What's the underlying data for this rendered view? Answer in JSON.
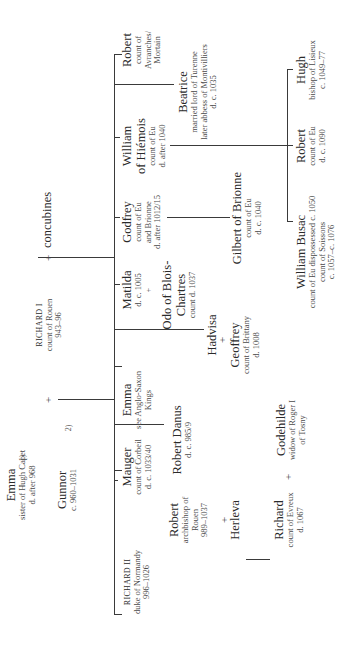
{
  "diagram": {
    "type": "genealogy",
    "orientation": "rotated-90-ccw",
    "generation_0": {
      "emma": {
        "name": "Emma",
        "lines": [
          "sister of Hugh Capet",
          "d. after 968"
        ],
        "marker": "1)"
      },
      "gunnor": {
        "name": "Gunnor",
        "lines": [
          "c. 960–1031"
        ],
        "marker": "2)"
      },
      "richard_i": {
        "name": "RICHARD I",
        "lines": [
          "count of Rouen",
          "943–96"
        ]
      },
      "concubines": {
        "name": "concubines"
      },
      "plus": "+"
    },
    "generation_1": [
      {
        "id": "richard_ii",
        "name": "RICHARD II",
        "lines": [
          "duke of Normandy",
          "996–1026"
        ]
      },
      {
        "id": "robert_abp",
        "name": "Robert",
        "lines": [
          "archbishop of",
          "Rouen",
          "989–1037"
        ]
      },
      {
        "id": "mauger",
        "name": "Mauger",
        "lines": [
          "count of Corbeil",
          "d. c. 1033/40"
        ]
      },
      {
        "id": "robert_danus",
        "name": "Robert Danus",
        "lines": [
          "d. c. 985/9"
        ]
      },
      {
        "id": "emma2",
        "name": "Emma",
        "lines": [
          "see Anglo-Saxon",
          "Kings"
        ]
      },
      {
        "id": "hadvisa",
        "name": "Hadvisa"
      },
      {
        "id": "matilda",
        "name": "Matilda",
        "lines": [
          "d. c. 1005"
        ]
      },
      {
        "id": "godfrey",
        "name": "Godfrey",
        "lines": [
          "count of Eu",
          "and Brionne",
          "d. after 1012/15"
        ]
      },
      {
        "id": "william_hiemois",
        "name": "William",
        "name2": "of Hiémois",
        "lines": [
          "count of Eu",
          "d. after 1040"
        ]
      },
      {
        "id": "beatrice",
        "name": "Beatrice",
        "lines": [
          "married lord of Turenne",
          "later abbess of Montivilliers",
          "d. c. 1035"
        ]
      },
      {
        "id": "robert_avranches",
        "name": "Robert",
        "lines": [
          "count of",
          "Avranches/",
          "Mortain"
        ]
      }
    ],
    "spouses": {
      "herleva": {
        "name": "Herleva"
      },
      "odo": {
        "name": "Odo of Blois-",
        "name2": "Chartres",
        "lines": [
          "count d. 1037"
        ]
      },
      "geoffrey": {
        "name": "Geoffrey",
        "lines": [
          "count of Brittany",
          "d. 1008"
        ]
      },
      "godehilde": {
        "name": "Godehilde",
        "lines": [
          "widow of Roger I",
          "of Tosny"
        ]
      }
    },
    "generation_2": [
      {
        "id": "richard_evreux",
        "name": "Richard",
        "lines": [
          "count of Evreux",
          "d. 1067"
        ]
      },
      {
        "id": "gilbert",
        "name": "Gilbert of Brionne",
        "lines": [
          "count of Eu",
          "d. c. 1040"
        ]
      },
      {
        "id": "william_busac",
        "name": "William Busac",
        "lines": [
          "count of Eu dispossessed c. 1050",
          "count of Soissons",
          "c. 1057–c. 1076"
        ]
      },
      {
        "id": "robert_eu",
        "name": "Robert",
        "lines": [
          "count of Eu",
          "d. c. 1090"
        ]
      },
      {
        "id": "hugh",
        "name": "Hugh",
        "lines": [
          "bishop of Lisieux",
          "c. 1049–77"
        ]
      }
    ]
  }
}
